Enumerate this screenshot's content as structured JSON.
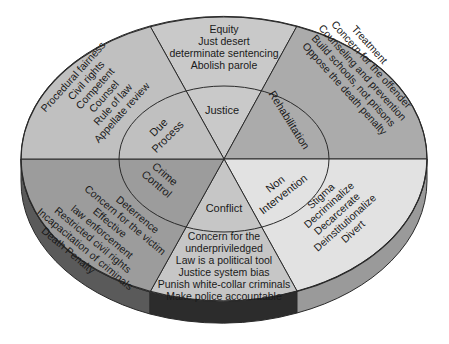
{
  "diagram": {
    "sectors": [
      {
        "id": "justice",
        "label": "Justice",
        "items": [
          "Equity",
          "Just desert",
          "determinate sentencing",
          "Abolish parole"
        ],
        "color": "#c9c9c9"
      },
      {
        "id": "rehabilitation",
        "label": "Rehabilitation",
        "items": [
          "Treatment",
          "Concern for the offender",
          "Counseling and prevention",
          "Build schools, not prisons",
          "Oppose the death penalty"
        ],
        "color": "#ababab"
      },
      {
        "id": "non-intervention",
        "label_lines": [
          "Non",
          "Intervention"
        ],
        "items": [
          "Stigma",
          "Decriminalize",
          "Decarcerate",
          "Deinstitutionalize",
          "Divert"
        ],
        "color": "#e2e2e2"
      },
      {
        "id": "conflict",
        "label": "Conflict",
        "items": [
          "Concern for the",
          "underpriviledged",
          "Law is a political tool",
          "Justice system bias",
          "Punish white-collar criminals",
          "Make police accountable"
        ],
        "color": "#c6c6c6"
      },
      {
        "id": "crime-control",
        "label_lines": [
          "Crime",
          "Control"
        ],
        "items": [
          "Deterrence",
          "Concern for the victim",
          "Effective",
          "law enforcement",
          "Restricted civil rights",
          "Incapacitation of criminals",
          "Death Penalty"
        ],
        "color": "#9c9c9c"
      },
      {
        "id": "due-process",
        "label_lines": [
          "Due",
          "Process"
        ],
        "items": [
          "Procedural fairness",
          "Civil rights",
          "Competent",
          "Counsel",
          "Rule of law",
          "Appellate review"
        ],
        "color": "#c0c0c0"
      }
    ],
    "rim_colors": {
      "left": "#5a5a5a",
      "bottom": "#2c2c2c",
      "right": "#9a9a9a"
    },
    "line_color": "#2a2a2a"
  }
}
